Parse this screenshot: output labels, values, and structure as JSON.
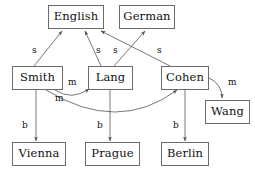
{
  "diagram": {
    "background_color": "#ffffff",
    "node_border_color": "#6b6b6b",
    "edge_color": "#555555",
    "text_color": "#111111"
  },
  "nodes": [
    {
      "id": "english",
      "label": "English",
      "x": 48,
      "y": 5,
      "w": 56,
      "h": 24
    },
    {
      "id": "german",
      "label": "German",
      "x": 119,
      "y": 5,
      "w": 56,
      "h": 24
    },
    {
      "id": "smith",
      "label": "Smith",
      "x": 12,
      "y": 66,
      "w": 51,
      "h": 24
    },
    {
      "id": "lang",
      "label": "Lang",
      "x": 88,
      "y": 66,
      "w": 45,
      "h": 24
    },
    {
      "id": "cohen",
      "label": "Cohen",
      "x": 161,
      "y": 66,
      "w": 48,
      "h": 24
    },
    {
      "id": "wang",
      "label": "Wang",
      "x": 205,
      "y": 100,
      "w": 45,
      "h": 24
    },
    {
      "id": "vienna",
      "label": "Vienna",
      "x": 12,
      "y": 142,
      "w": 54,
      "h": 24
    },
    {
      "id": "prague",
      "label": "Prague",
      "x": 85,
      "y": 142,
      "w": 55,
      "h": 24
    },
    {
      "id": "berlin",
      "label": "Berlin",
      "x": 161,
      "y": 142,
      "w": 48,
      "h": 24
    }
  ],
  "edges": [
    {
      "id": "smith-english",
      "from": "smith",
      "to": "english",
      "label": "s",
      "label_x": 32,
      "label_y": 46,
      "kind": "line",
      "path": "M 34,66 L 62,31"
    },
    {
      "id": "lang-english",
      "from": "lang",
      "to": "english",
      "label": "s",
      "label_x": 96,
      "label_y": 46,
      "kind": "line",
      "path": "M 101,66 L 85,31"
    },
    {
      "id": "lang-german",
      "from": "lang",
      "to": "german",
      "label": "s",
      "label_x": 113,
      "label_y": 46,
      "kind": "line",
      "path": "M 114,66 L 145,31"
    },
    {
      "id": "cohen-english",
      "from": "cohen",
      "to": "english",
      "label": "s",
      "label_x": 157,
      "label_y": 46,
      "kind": "line",
      "path": "M 170,66 L 101,31"
    },
    {
      "id": "smith-lang",
      "from": "smith",
      "to": "lang",
      "label": "m",
      "label_x": 68,
      "label_y": 78,
      "kind": "curve",
      "path": "M 55,90 Q 72,101 89,89"
    },
    {
      "id": "smith-cohen",
      "from": "smith",
      "to": "cohen",
      "label": "m",
      "label_x": 55,
      "label_y": 94,
      "kind": "curve",
      "path": "M 46,90 Q 118,134 177,90"
    },
    {
      "id": "cohen-wang",
      "from": "cohen",
      "to": "wang",
      "label": "m",
      "label_x": 228,
      "label_y": 78,
      "kind": "curve",
      "path": "M 209,78 Q 222,84 222,98"
    },
    {
      "id": "smith-vienna",
      "from": "smith",
      "to": "vienna",
      "label": "b",
      "label_x": 22,
      "label_y": 121,
      "kind": "line",
      "path": "M 36,90 L 36,141"
    },
    {
      "id": "lang-prague",
      "from": "lang",
      "to": "prague",
      "label": "b",
      "label_x": 97,
      "label_y": 121,
      "kind": "line",
      "path": "M 110,90 L 110,141"
    },
    {
      "id": "cohen-berlin",
      "from": "cohen",
      "to": "berlin",
      "label": "b",
      "label_x": 173,
      "label_y": 121,
      "kind": "line",
      "path": "M 185,90 L 185,141"
    }
  ],
  "legend": {
    "s_meaning": "s",
    "m_meaning": "m",
    "b_meaning": "b"
  }
}
